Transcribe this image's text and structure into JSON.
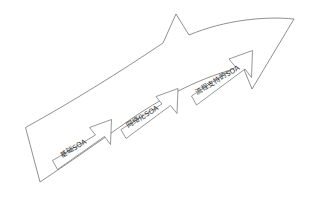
{
  "diagram": {
    "type": "arrow-progression",
    "title": "",
    "orientation": "ascending-left-to-right",
    "background_color": "#ffffff",
    "stroke_color": "#6b6b6b",
    "text_color": "#2b2b2b",
    "big_arrow": {
      "name": "overall-evolution-arrow",
      "direction": "up-right",
      "fill": "#ffffff"
    },
    "stages": [
      {
        "index": 1,
        "label": "基础SOA",
        "position": "lower-left",
        "rotation_deg": -31
      },
      {
        "index": 2,
        "label": "网络化SOA",
        "position": "middle",
        "rotation_deg": -31
      },
      {
        "index": 3,
        "label": "流程支持的SOA",
        "position": "upper-right",
        "rotation_deg": -31
      }
    ]
  }
}
